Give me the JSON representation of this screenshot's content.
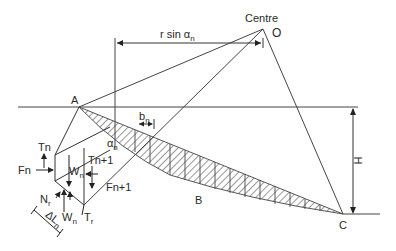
{
  "diagram": {
    "type": "slope-stability-method-of-slices",
    "labels": {
      "centre": "Centre",
      "O": "O",
      "A": "A",
      "B": "B",
      "C": "C",
      "H": "H",
      "r_sin": "r sin α",
      "r_sin_sub": "n",
      "b": "b",
      "b_sub": "n",
      "alpha": "α",
      "alpha_sub": "n",
      "Tn": "Tn",
      "Fn": "Fn",
      "Wn": "W",
      "Wn_sub": "n",
      "Tn1": "Tn+1",
      "Fn1": "Fn+1",
      "Nr": "N",
      "Nr_sub": "r",
      "dL": "ΔL",
      "dL_sub": "n",
      "Wn2": "W",
      "Wn2_sub": "n",
      "Tr": "T",
      "Tr_sub": "r"
    },
    "colors": {
      "line": "#3a3a3a",
      "hatch": "#444444",
      "background": "#ffffff"
    }
  }
}
